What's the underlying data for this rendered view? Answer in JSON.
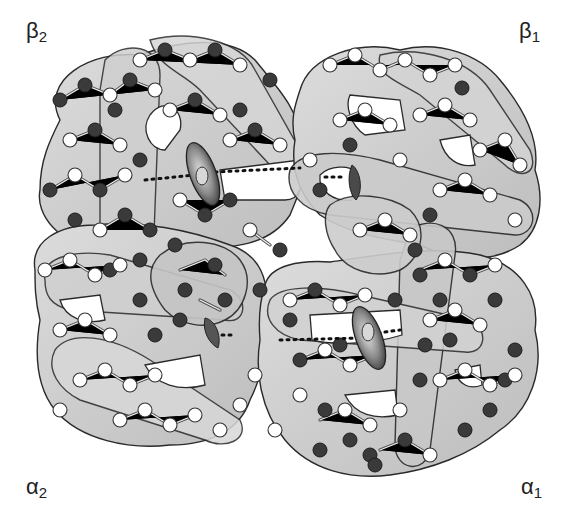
{
  "figure": {
    "subunit_labels": {
      "beta2": {
        "greek": "β",
        "sub": "2"
      },
      "beta1": {
        "greek": "β",
        "sub": "1"
      },
      "alpha2": {
        "greek": "α",
        "sub": "2"
      },
      "alpha1": {
        "greek": "α",
        "sub": "1"
      }
    },
    "colors": {
      "ribbon_fill": "#c9c9c9",
      "ribbon_fill_light": "#dedede",
      "ribbon_outline": "#2a2a2a",
      "atom_light": "#ffffff",
      "atom_dark": "#3a3a3a",
      "heme_dark": "#4a4a4a",
      "heme_light": "#d0d0d0",
      "background": "#ffffff"
    },
    "hemes": [
      {
        "subunit": "beta2",
        "cx": 203,
        "cy": 174
      },
      {
        "subunit": "beta1",
        "cx": 352,
        "cy": 182
      },
      {
        "subunit": "alpha2",
        "cx": 213,
        "cy": 332
      },
      {
        "subunit": "alpha1",
        "cx": 369,
        "cy": 338
      }
    ]
  }
}
